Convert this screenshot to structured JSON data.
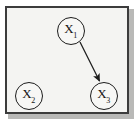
{
  "figure": {
    "title": "",
    "background_color": "#f4f4f2",
    "frame_color": "#3c3c3c",
    "node_color": "#1c1c1c",
    "edge_color": "#1c1c1c"
  },
  "graph": {
    "type": "directed-acyclic-graph",
    "nodes": [
      {
        "id": "X1",
        "symbol": "X",
        "subscript": "1",
        "label": "X1",
        "cx": 71,
        "cy": 31,
        "r": 14
      },
      {
        "id": "X2",
        "symbol": "X",
        "subscript": "2",
        "label": "X2",
        "cx": 29,
        "cy": 96,
        "r": 14
      },
      {
        "id": "X3",
        "symbol": "X",
        "subscript": "3",
        "label": "X3",
        "cx": 104,
        "cy": 96,
        "r": 14
      }
    ],
    "edges": [
      {
        "from": "X1",
        "to": "X3",
        "directed": true,
        "x1": 80,
        "y1": 42,
        "x2": 99,
        "y2": 81
      }
    ]
  }
}
